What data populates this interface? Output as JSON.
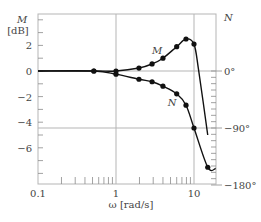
{
  "chart_data": {
    "type": "line",
    "title": "",
    "xlabel": "ω [rad/s]",
    "ylabel": "M [dB]",
    "ylabel_right": "N",
    "x_scale": "log",
    "xlim": [
      0.1,
      19
    ],
    "ylim": [
      -8.8,
      4.5
    ],
    "ylim_right_deg": [
      -180,
      0
    ],
    "x_ticks": [
      {
        "value": 0.1,
        "label": "0.1"
      },
      {
        "value": 1,
        "label": "1"
      },
      {
        "value": 10,
        "label": "10"
      }
    ],
    "y_ticks": [
      {
        "value": 2,
        "label": "2"
      },
      {
        "value": 0,
        "label": "0"
      },
      {
        "value": -2,
        "label": "−2"
      },
      {
        "value": -4,
        "label": "−4"
      },
      {
        "value": -6,
        "label": "−6"
      }
    ],
    "y_ticks_right": [
      {
        "value": 0,
        "label": "0°"
      },
      {
        "value": -90,
        "label": "−90°"
      },
      {
        "value": -180,
        "label": "−180°"
      }
    ],
    "gridlines": {
      "x": [
        1,
        10
      ],
      "y_dB": [
        0
      ],
      "y_deg": [
        -90
      ]
    },
    "legend": "none (curves labeled inline)",
    "series": [
      {
        "name": "M",
        "axis": "left",
        "unit": "dB",
        "points": [
          {
            "x": 0.52,
            "y": 0.0
          },
          {
            "x": 1.0,
            "y": 0.0
          },
          {
            "x": 1.97,
            "y": 0.23
          },
          {
            "x": 2.9,
            "y": 0.55
          },
          {
            "x": 4.0,
            "y": 1.0
          },
          {
            "x": 6.0,
            "y": 1.9
          },
          {
            "x": 7.9,
            "y": 2.5
          },
          {
            "x": 10.0,
            "y": 2.1
          }
        ],
        "curve_tail": [
          {
            "x": 11.5,
            "y": 0.0
          },
          {
            "x": 15.0,
            "y": -5.0
          }
        ]
      },
      {
        "name": "N",
        "axis": "right",
        "unit": "deg",
        "points": [
          {
            "x": 0.52,
            "y": 0
          },
          {
            "x": 1.0,
            "y": -5
          },
          {
            "x": 1.97,
            "y": -13
          },
          {
            "x": 2.9,
            "y": -17
          },
          {
            "x": 4.0,
            "y": -24
          },
          {
            "x": 6.0,
            "y": -36
          },
          {
            "x": 7.9,
            "y": -54
          },
          {
            "x": 10.0,
            "y": -90
          },
          {
            "x": 15.0,
            "y": -152
          }
        ],
        "curve_tail": [
          {
            "x": 19.0,
            "y": -154
          }
        ]
      }
    ],
    "annotations": [
      {
        "text": "M",
        "near_x": 4.9,
        "near_y_dB": 1.6
      },
      {
        "text": "N",
        "near_x": 7.3,
        "near_deg": -49
      }
    ]
  },
  "labels": {
    "y_left_line1": "M",
    "y_left_line2": "[dB]",
    "y_right": "N",
    "x_axis": "ω [rad/s]",
    "curve_m": "M",
    "curve_n": "N"
  }
}
